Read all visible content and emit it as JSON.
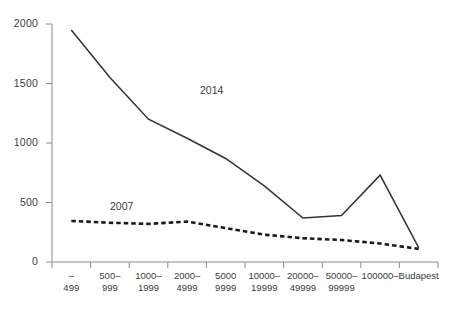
{
  "chart_data": {
    "type": "line",
    "title": "",
    "xlabel": "",
    "ylabel": "",
    "ylim": [
      0,
      2000
    ],
    "yticks": [
      0,
      500,
      1000,
      1500,
      2000
    ],
    "grid": false,
    "legend_position": "inline-annotation",
    "categories": [
      "–\n499",
      "500–\n999",
      "1000–\n1999",
      "2000–\n4999",
      "5000\n9999",
      "10000–\n19999",
      "20000–\n49999",
      "50000–\n99999",
      "100000–",
      "Budapest"
    ],
    "category_lines": [
      [
        "–",
        "499"
      ],
      [
        "500–",
        "999"
      ],
      [
        "1000–",
        "1999"
      ],
      [
        "2000–",
        "4999"
      ],
      [
        "5000",
        "9999"
      ],
      [
        "10000–",
        "19999"
      ],
      [
        "20000–",
        "49999"
      ],
      [
        "50000–",
        "99999"
      ],
      [
        "100000–",
        ""
      ],
      [
        "Budapest",
        ""
      ]
    ],
    "series": [
      {
        "name": "2014",
        "style": "solid",
        "color": "#333333",
        "values": [
          1950,
          1550,
          1200,
          1040,
          870,
          640,
          370,
          390,
          730,
          120
        ]
      },
      {
        "name": "2007",
        "style": "dashed",
        "color": "#1a1a1a",
        "values": [
          345,
          330,
          320,
          340,
          285,
          230,
          200,
          185,
          155,
          110
        ]
      }
    ],
    "annotations": [
      {
        "text": "2014",
        "x_px": 200,
        "y_px": 84
      },
      {
        "text": "2007",
        "x_px": 110,
        "y_px": 200
      }
    ]
  },
  "axis": {
    "ytick_labels": [
      "2000",
      "1500",
      "1000",
      "500",
      "0"
    ],
    "axis_color": "#8c8c8c"
  }
}
